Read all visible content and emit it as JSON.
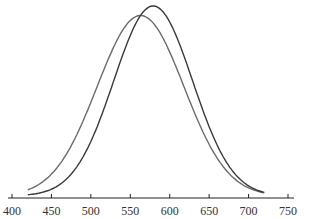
{
  "chart_data": {
    "type": "line",
    "title": "",
    "xlabel": "",
    "ylabel": "",
    "xlim": [
      400,
      750
    ],
    "xticks": [
      400,
      450,
      500,
      550,
      600,
      650,
      700,
      750
    ],
    "xtick_labels": [
      "400",
      "450",
      "500",
      "550",
      "600",
      "650",
      "700",
      "750"
    ],
    "grid": false,
    "legend": null,
    "series": [
      {
        "name": "Distribution A (shorter, left)",
        "mean": 563,
        "sd": 55,
        "peak_rel": 0.95,
        "x_range": [
          420,
          720
        ],
        "color": "#6b6b6b"
      },
      {
        "name": "Distribution B (taller, right)",
        "mean": 579,
        "sd": 50,
        "peak_rel": 1.0,
        "x_range": [
          420,
          720
        ],
        "color": "#3a3a3a"
      }
    ]
  }
}
